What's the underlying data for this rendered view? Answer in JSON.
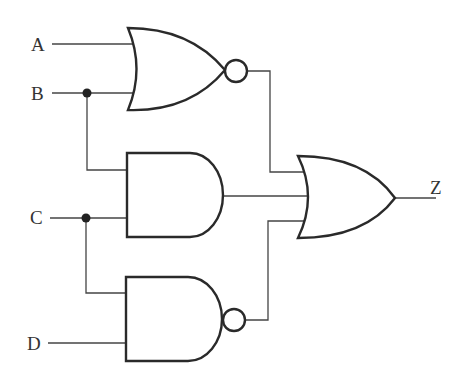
{
  "diagram": {
    "type": "logic-circuit",
    "inputs": [
      {
        "label": "A"
      },
      {
        "label": "B"
      },
      {
        "label": "C"
      },
      {
        "label": "D"
      }
    ],
    "output": {
      "label": "Z"
    },
    "gates": [
      {
        "id": "g1",
        "type": "NOR",
        "inputs": [
          "A",
          "B"
        ]
      },
      {
        "id": "g2",
        "type": "AND",
        "inputs": [
          "B",
          "C"
        ]
      },
      {
        "id": "g3",
        "type": "NAND",
        "inputs": [
          "C",
          "D"
        ]
      },
      {
        "id": "g4",
        "type": "OR",
        "inputs": [
          "g1",
          "g2",
          "g3"
        ],
        "output": "Z"
      }
    ],
    "colors": {
      "stroke": "#2a2a2a",
      "background": "#ffffff"
    }
  }
}
